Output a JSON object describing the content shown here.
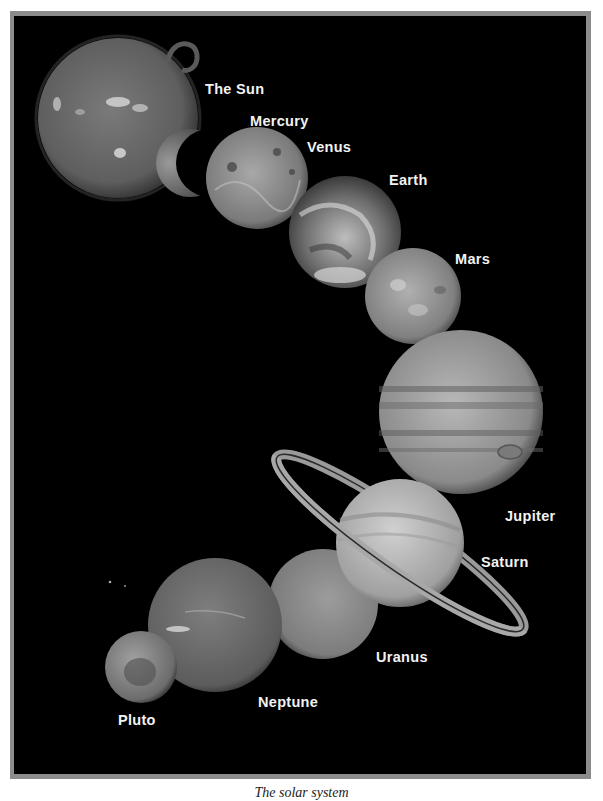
{
  "figure": {
    "caption": "The solar system",
    "background_color": "#000000",
    "frame_color": "#8c8c8c",
    "label_color": "#f2f2f2"
  },
  "bodies": [
    {
      "name": "The Sun",
      "label_pos": [
        205,
        80
      ]
    },
    {
      "name": "Mercury",
      "label_pos": [
        250,
        112
      ]
    },
    {
      "name": "Venus",
      "label_pos": [
        307,
        138
      ]
    },
    {
      "name": "Earth",
      "label_pos": [
        389,
        171
      ]
    },
    {
      "name": "Mars",
      "label_pos": [
        455,
        251
      ]
    },
    {
      "name": "Jupiter",
      "label_pos": [
        505,
        508
      ]
    },
    {
      "name": "Saturn",
      "label_pos": [
        481,
        554
      ]
    },
    {
      "name": "Uranus",
      "label_pos": [
        376,
        650
      ]
    },
    {
      "name": "Neptune",
      "label_pos": [
        258,
        694
      ]
    },
    {
      "name": "Pluto",
      "label_pos": [
        118,
        712
      ]
    }
  ]
}
